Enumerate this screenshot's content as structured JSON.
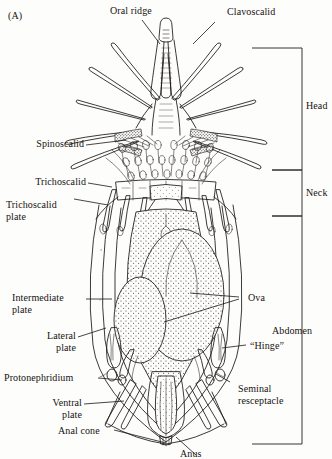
{
  "figure": {
    "panel_label": "(A)",
    "background_color": "#fdfdfc",
    "ink_color": "#1a1714"
  },
  "labels": {
    "top": [
      {
        "id": "oral-ridge",
        "text": "Oral ridge"
      },
      {
        "id": "clavoscalid",
        "text": "Clavoscalid"
      }
    ],
    "left": [
      {
        "id": "spinoscalid",
        "text": "Spinoscalid"
      },
      {
        "id": "trichoscalid",
        "text": "Trichoscalid"
      },
      {
        "id": "trichoscalid-plate",
        "text": "Trichoscalid\nplate"
      },
      {
        "id": "intermediate-plate",
        "text": "Intermediate\nplate"
      },
      {
        "id": "lateral-plate",
        "text": "Lateral\nplate"
      },
      {
        "id": "protonephridium",
        "text": "Protonephridium"
      },
      {
        "id": "ventral-plate",
        "text": "Ventral\nplate"
      },
      {
        "id": "anal-cone",
        "text": "Anal cone"
      }
    ],
    "right": [
      {
        "id": "ova",
        "text": "Ova"
      },
      {
        "id": "hinge",
        "text": "“Hinge”"
      },
      {
        "id": "seminal-resceptacle",
        "text": "Seminal\nresceptacle"
      }
    ],
    "bottom": [
      {
        "id": "anus",
        "text": "Anus"
      }
    ]
  },
  "brackets": [
    {
      "id": "head",
      "text": "Head"
    },
    {
      "id": "neck",
      "text": "Neck"
    },
    {
      "id": "abdomen",
      "text": "Abdomen"
    }
  ]
}
